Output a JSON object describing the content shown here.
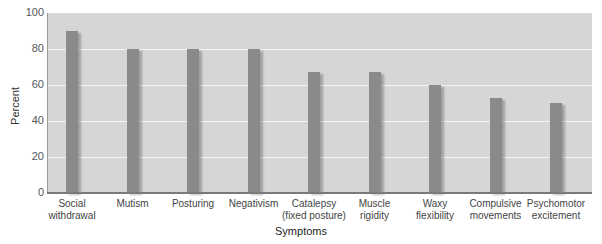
{
  "chart_data": {
    "type": "bar",
    "title": "",
    "xlabel": "Symptoms",
    "ylabel": "Percent",
    "ylim": [
      0,
      100
    ],
    "yticks": [
      "0",
      "20",
      "40",
      "60",
      "80",
      "100"
    ],
    "grid": true,
    "legend": null,
    "categories": [
      "Social withdrawal",
      "Mutism",
      "Posturing",
      "Negativism",
      "Catalepsy (fixed posture)",
      "Muscle rigidity",
      "Waxy flexibility",
      "Compulsive movements",
      "Psychomotor excitement"
    ],
    "category_lines": [
      [
        "Social",
        "withdrawal"
      ],
      [
        "Mutism",
        ""
      ],
      [
        "Posturing",
        ""
      ],
      [
        "Negativism",
        ""
      ],
      [
        "Catalepsy",
        "(fixed posture)"
      ],
      [
        "Muscle",
        "rigidity"
      ],
      [
        "Waxy",
        "flexibility"
      ],
      [
        "Compulsive",
        "movements"
      ],
      [
        "Psychomotor",
        "excitement"
      ]
    ],
    "values": [
      90,
      80,
      80,
      80,
      67,
      67,
      60,
      53,
      50
    ],
    "colors": {
      "bar": "#8a8a8a",
      "plot_bg": "#d6d6d6",
      "grid": "#f4f4f4"
    }
  }
}
